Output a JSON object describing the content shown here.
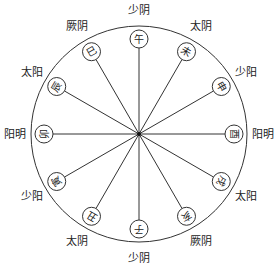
{
  "diagram": {
    "type": "earthly-branches six-qi wheel",
    "center": {
      "x": 139,
      "y": 134
    },
    "outer_radius": 108,
    "node_radius": 95,
    "node_circle_radius": 9,
    "label_radius": 124,
    "colors": {
      "line": "#333333",
      "text": "#222222",
      "background": "#ffffff"
    },
    "branches": [
      {
        "char": "午",
        "angle": 0
      },
      {
        "char": "未",
        "angle": 30
      },
      {
        "char": "申",
        "angle": 60
      },
      {
        "char": "酉",
        "angle": 90
      },
      {
        "char": "戌",
        "angle": 120
      },
      {
        "char": "亥",
        "angle": 150
      },
      {
        "char": "子",
        "angle": 180
      },
      {
        "char": "丑",
        "angle": 210
      },
      {
        "char": "寅",
        "angle": 240
      },
      {
        "char": "卯",
        "angle": 270
      },
      {
        "char": "辰",
        "angle": 300
      },
      {
        "char": "巳",
        "angle": 330
      }
    ],
    "qi_labels": [
      {
        "text": "少阴",
        "angle": 0
      },
      {
        "text": "太阴",
        "angle": 30
      },
      {
        "text": "少阳",
        "angle": 60
      },
      {
        "text": "阳明",
        "angle": 90
      },
      {
        "text": "太阳",
        "angle": 120
      },
      {
        "text": "厥阴",
        "angle": 150
      },
      {
        "text": "少阴",
        "angle": 180
      },
      {
        "text": "太阴",
        "angle": 210
      },
      {
        "text": "少阳",
        "angle": 240
      },
      {
        "text": "阳明",
        "angle": 270
      },
      {
        "text": "太阳",
        "angle": 300
      },
      {
        "text": "厥阴",
        "angle": 330
      }
    ]
  }
}
